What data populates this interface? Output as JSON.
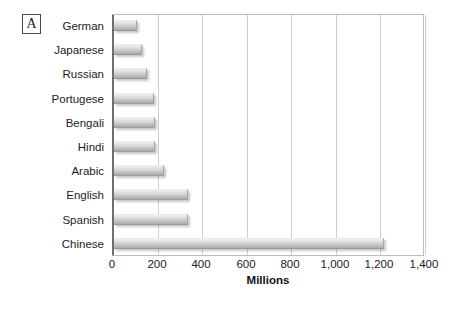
{
  "panel": {
    "letter": "A"
  },
  "chart_data": {
    "type": "bar",
    "orientation": "horizontal",
    "title": "",
    "subtitle": "",
    "xlabel": "Millions",
    "ylabel": "",
    "xlim": [
      0,
      1400
    ],
    "ylim": null,
    "grid": "vertical",
    "legend": "none",
    "xticks": [
      0,
      200,
      400,
      600,
      800,
      1000,
      1200,
      1400
    ],
    "xticklabels": [
      "0",
      "200",
      "400",
      "600",
      "800",
      "1,000",
      "1,200",
      "1,400"
    ],
    "categories": [
      "German",
      "Japanese",
      "Russian",
      "Portugese",
      "Bengali",
      "Hindi",
      "Arabic",
      "English",
      "Spanish",
      "Chinese"
    ],
    "values": [
      105,
      125,
      150,
      180,
      185,
      185,
      225,
      330,
      330,
      1210
    ],
    "series": [
      {
        "name": "Speakers",
        "values": [
          105,
          125,
          150,
          180,
          185,
          185,
          225,
          330,
          330,
          1210
        ]
      }
    ],
    "colors": {
      "bar_top": "#f2f2f2",
      "bar_bottom": "#ababab",
      "gridline": "#cfcfcf",
      "axis": "#6f6f6f",
      "text": "#1c1c1c"
    }
  }
}
